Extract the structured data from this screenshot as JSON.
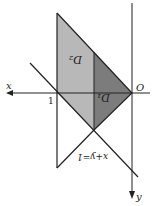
{
  "diagram": {
    "orientation": "rotated 180 degrees",
    "axes": {
      "x_label": "x",
      "y_label": "y",
      "origin_label": "O"
    },
    "tick_label": "1",
    "regions": [
      {
        "name": "D2",
        "label": "D₂",
        "color": "#b4b4b4"
      },
      {
        "name": "D1",
        "label": "D₁",
        "color": "#7a7a7a"
      }
    ],
    "line_label": "x+y=1"
  }
}
